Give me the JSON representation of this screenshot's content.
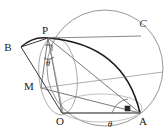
{
  "figure": {
    "background_color": "#ffffff",
    "stroke_color_thin": "#6b6b6b",
    "stroke_color_thick": "#1a1a1a",
    "label_color": "#1a1a1a"
  },
  "labels": {
    "B": "B",
    "P": "P",
    "C": "C",
    "M": "M",
    "O": "O",
    "A": "A",
    "theta_top": "θ",
    "theta_bottom": "θ"
  },
  "points": {
    "O": {
      "x": 62,
      "y": 113
    },
    "A": {
      "x": 140,
      "y": 113
    },
    "P": {
      "x": 48,
      "y": 38
    },
    "B": {
      "x": 21,
      "y": 47
    },
    "M": {
      "x": 41,
      "y": 88
    },
    "C_label_anchor": {
      "x": 140,
      "y": 25
    }
  },
  "circles": {
    "big_circle": {
      "cx": 105,
      "cy": 68,
      "r": 58
    },
    "small_circle": {
      "cx": 58,
      "cy": 77,
      "rx": 19,
      "ry": 39,
      "rotation": -8
    },
    "base_circle": {
      "cx": 101,
      "cy": 110,
      "rx": 40,
      "ry": 12
    }
  },
  "segments": [
    {
      "name": "O-A",
      "from": "O",
      "to": "A"
    },
    {
      "name": "O-P",
      "from": "O",
      "to": "P"
    },
    {
      "name": "O-M",
      "from": "O",
      "to": "M"
    },
    {
      "name": "P-A",
      "from": "P",
      "to": "A"
    },
    {
      "name": "M-A",
      "from": "M",
      "to": "A"
    },
    {
      "name": "P-M",
      "from": "P",
      "to": "M"
    },
    {
      "name": "B-P",
      "from": "B",
      "to": "P"
    },
    {
      "name": "B-M",
      "from": "B",
      "to": "M"
    },
    {
      "name": "P-top-right",
      "from": "P",
      "to": "C"
    }
  ],
  "arcs": {
    "arc_B_P": "thick arc from B to P",
    "arc_P_A": "thick arc bulging right from P to A"
  },
  "markers": {
    "right_angle_at_P": {
      "x": 49,
      "y": 46
    },
    "right_angle_on_OA": {
      "x": 128,
      "y": 109
    },
    "angle_arc_at_A": {
      "cx": 140,
      "cy": 113,
      "r": 28
    },
    "angle_arc_at_P": {
      "cx": 48,
      "cy": 38,
      "r": 22
    }
  },
  "angle_labels": {
    "theta_at_P": {
      "x": 45,
      "y": 65,
      "text": "θ"
    },
    "theta_at_A": {
      "x": 107,
      "y": 126,
      "text": "θ"
    }
  }
}
